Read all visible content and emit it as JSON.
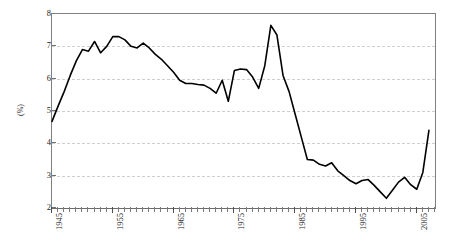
{
  "chart_data": {
    "type": "line",
    "title": "",
    "subtitle": "",
    "xlabel": "",
    "ylabel": "(%)",
    "xlim": [
      1945,
      2008
    ],
    "ylim": [
      2,
      8
    ],
    "grid": true,
    "legend": false,
    "legend_position": "none",
    "line_color": "#000000",
    "line_width": 1.6,
    "y_ticks": [
      2,
      3,
      4,
      5,
      6,
      7,
      8
    ],
    "y_tick_labels": [
      "2",
      "3",
      "4",
      "5",
      "6",
      "7",
      "8"
    ],
    "x_ticks_labeled": [
      1945,
      1955,
      1965,
      1975,
      1985,
      1995,
      2005
    ],
    "x_tick_labels": [
      "1945",
      "1955",
      "1965",
      "1975",
      "1985",
      "1995",
      "2005"
    ],
    "x_tick_interval_years": 1,
    "x": [
      1945,
      1946,
      1947,
      1948,
      1949,
      1950,
      1951,
      1952,
      1953,
      1954,
      1955,
      1956,
      1957,
      1958,
      1959,
      1960,
      1961,
      1962,
      1963,
      1964,
      1965,
      1966,
      1967,
      1968,
      1969,
      1970,
      1971,
      1972,
      1973,
      1974,
      1975,
      1976,
      1977,
      1978,
      1979,
      1980,
      1981,
      1982,
      1983,
      1984,
      1985,
      1986,
      1987,
      1988,
      1989,
      1990,
      1991,
      1992,
      1993,
      1994,
      1995,
      1996,
      1997,
      1998,
      1999,
      2000,
      2001,
      2002,
      2003,
      2004,
      2005,
      2006,
      2007
    ],
    "values": [
      4.68,
      5.15,
      5.6,
      6.1,
      6.55,
      6.9,
      6.85,
      7.15,
      6.8,
      7.0,
      7.3,
      7.3,
      7.2,
      7.0,
      6.95,
      7.1,
      6.95,
      6.75,
      6.6,
      6.4,
      6.2,
      5.95,
      5.85,
      5.85,
      5.82,
      5.8,
      5.7,
      5.55,
      5.95,
      5.3,
      6.25,
      6.3,
      6.28,
      6.05,
      5.7,
      6.4,
      7.65,
      7.35,
      6.1,
      5.6,
      4.9,
      4.2,
      3.5,
      3.48,
      3.35,
      3.3,
      3.4,
      3.15,
      3.0,
      2.85,
      2.75,
      2.85,
      2.88,
      2.7,
      2.5,
      2.3,
      2.55,
      2.8,
      2.95,
      2.72,
      2.58,
      3.1,
      4.4
    ],
    "series_name": "",
    "annotations": []
  }
}
